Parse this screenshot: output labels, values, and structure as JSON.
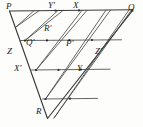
{
  "figure": {
    "kind": "geometric-diagram",
    "stroke_color": "#3a3a3a",
    "background_color": "#fdfdfc",
    "label_color": "#1b1b1b",
    "vertices": {
      "P": "P",
      "Q": "Q",
      "R": "R"
    },
    "labels": [
      {
        "id": "P",
        "text": "P",
        "x": 6,
        "y": 3
      },
      {
        "id": "Yprime",
        "text": "Y'",
        "x": 48,
        "y": 2
      },
      {
        "id": "X",
        "text": "X",
        "x": 72,
        "y": 2
      },
      {
        "id": "Q",
        "text": "Q",
        "x": 127,
        "y": 4
      },
      {
        "id": "Rprime",
        "text": "R'",
        "x": 45,
        "y": 25
      },
      {
        "id": "Z",
        "text": "Z",
        "x": 7,
        "y": 49
      },
      {
        "id": "Qprime",
        "text": "Q'",
        "x": 26,
        "y": 40
      },
      {
        "id": "Pprime",
        "text": "P'",
        "x": 66,
        "y": 41
      },
      {
        "id": "Zprime",
        "text": "Z'",
        "x": 94,
        "y": 49
      },
      {
        "id": "Xprime",
        "text": "X'",
        "x": 14,
        "y": 65
      },
      {
        "id": "Y",
        "text": "Y",
        "x": 76,
        "y": 65
      },
      {
        "id": "R",
        "text": "R",
        "x": 35,
        "y": 107
      }
    ],
    "outline_paths": [
      "M 10 11 L 132 10",
      "M 10 11 L 47 118",
      "M 132 10 L 47 118"
    ],
    "grid_paths": [
      "M 21 41 L 121 40",
      "M 32 70 L 109 69",
      "M 43 98 L 96 97",
      "M 34 11 L 16 27",
      "M 55 11 L 25 41",
      "M 76 11 L 36 70",
      "M 97 11 L 45 98",
      "M 118 11 L 59 118",
      "M 16 27 L 40 11",
      "M 25 41 L 62 11",
      "M 36 70 L 83 11",
      "M 45 98 L 104 11",
      "M 59 118 L 125 11"
    ]
  }
}
